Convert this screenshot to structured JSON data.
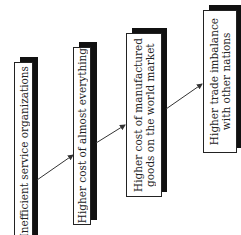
{
  "diagram": {
    "type": "flow",
    "direction": "left-to-right",
    "nodes": [
      {
        "id": "n1",
        "label": "Inefficient service organizations",
        "lines": [
          "Inefficient service organizations"
        ]
      },
      {
        "id": "n2",
        "label": "Higher cost of almost everything",
        "lines": [
          "Higher cost of almost everything"
        ]
      },
      {
        "id": "n3",
        "label": "Higher cost of manufactured goods on the world market",
        "lines": [
          "Higher cost of manufactured",
          "goods on the world market"
        ]
      },
      {
        "id": "n4",
        "label": "Higher trade imbalance with other nations",
        "lines": [
          "Higher trade imbalance",
          "with other nations"
        ]
      }
    ],
    "edges": [
      {
        "from": "n1",
        "to": "n2"
      },
      {
        "from": "n2",
        "to": "n3"
      },
      {
        "from": "n3",
        "to": "n4"
      }
    ],
    "colors": {
      "box_fill": "#ffffff",
      "border": "#222222",
      "shadow": "#111111",
      "arrow": "#333333"
    }
  }
}
